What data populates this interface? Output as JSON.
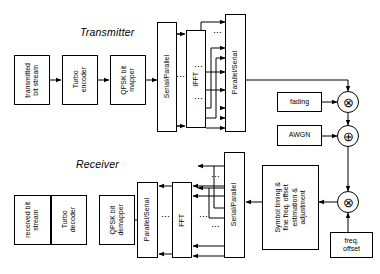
{
  "diagram": {
    "sections": {
      "transmitter": "Transmitter",
      "receiver": "Receiver"
    },
    "colors": {
      "line": "#000000",
      "box_fill": "#ffffff",
      "background": "#ffffff"
    },
    "transmitter_blocks": [
      {
        "id": "tx-bit-stream",
        "label": "transmitted\nbit stream",
        "orientation": "vertical"
      },
      {
        "id": "turbo-encoder",
        "label": "Turbo\nencoder",
        "orientation": "vertical"
      },
      {
        "id": "qpsk-mapper",
        "label": "QPSK bit\nmapper",
        "orientation": "vertical"
      },
      {
        "id": "tx-serial-parallel",
        "label": "Serial/Parallel",
        "orientation": "vertical"
      },
      {
        "id": "ifft",
        "label": "IFFT",
        "orientation": "vertical"
      },
      {
        "id": "tx-parallel-serial",
        "label": "Parallel/Serial",
        "orientation": "vertical"
      }
    ],
    "channel_blocks": [
      {
        "id": "fading",
        "label": "fading",
        "orientation": "horizontal"
      },
      {
        "id": "awgn",
        "label": "AWGN",
        "orientation": "horizontal"
      },
      {
        "id": "freq-offset",
        "label": "freq.\noffset",
        "orientation": "horizontal"
      }
    ],
    "receiver_blocks": [
      {
        "id": "rx-bit-stream",
        "label": "received bit\nstream",
        "orientation": "vertical"
      },
      {
        "id": "turbo-decoder",
        "label": "Turbo\ndecoder",
        "orientation": "vertical"
      },
      {
        "id": "qpsk-demapper",
        "label": "QPSK bit\ndemapper",
        "orientation": "vertical"
      },
      {
        "id": "rx-parallel-serial",
        "label": "Parallel/Serial",
        "orientation": "vertical"
      },
      {
        "id": "fft",
        "label": "FFT",
        "orientation": "vertical"
      },
      {
        "id": "rx-serial-parallel",
        "label": "Serial/Parallel",
        "orientation": "vertical"
      },
      {
        "id": "sync-block",
        "label": "Symbol timing &\nfine freq. offset\nestimation &\nadjustment",
        "orientation": "vertical"
      }
    ],
    "operators": [
      {
        "id": "mixer-fading",
        "symbol": "⊗",
        "meaning": "multiply"
      },
      {
        "id": "adder-awgn",
        "symbol": "⊕",
        "meaning": "add"
      },
      {
        "id": "mixer-freq-offset",
        "symbol": "⊗",
        "meaning": "multiply"
      }
    ],
    "ellipses": "⋮"
  }
}
